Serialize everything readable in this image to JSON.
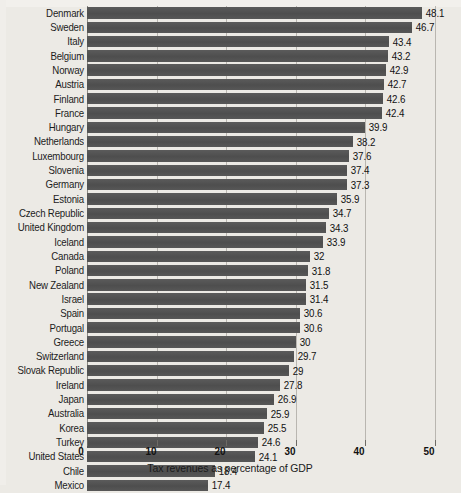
{
  "chart_data": {
    "type": "bar",
    "orientation": "horizontal",
    "title": "",
    "xlabel": "Tax revenues as percentage of GDP",
    "ylabel": "",
    "xlim": [
      0,
      50
    ],
    "xticks": [
      0,
      10,
      20,
      30,
      40,
      50
    ],
    "grid": true,
    "legend": false,
    "bar_color": "#545454",
    "background_color": "#eceae5",
    "categories": [
      "Denmark",
      "Sweden",
      "Italy",
      "Belgium",
      "Norway",
      "Austria",
      "Finland",
      "France",
      "Hungary",
      "Netherlands",
      "Luxembourg",
      "Slovenia",
      "Germany",
      "Estonia",
      "Czech Republic",
      "United Kingdom",
      "Iceland",
      "Canada",
      "Poland",
      "New Zealand",
      "Israel",
      "Spain",
      "Portugal",
      "Greece",
      "Switzerland",
      "Slovak Republic",
      "Ireland",
      "Japan",
      "Australia",
      "Korea",
      "Turkey",
      "United States",
      "Chile",
      "Mexico"
    ],
    "values": [
      48.1,
      46.7,
      43.4,
      43.2,
      42.9,
      42.7,
      42.6,
      42.4,
      39.9,
      38.2,
      37.6,
      37.4,
      37.3,
      35.9,
      34.7,
      34.3,
      33.9,
      32,
      31.8,
      31.5,
      31.4,
      30.6,
      30.6,
      30,
      29.7,
      29,
      27.8,
      26.9,
      25.9,
      25.5,
      24.6,
      24.1,
      18.4,
      17.4
    ],
    "value_labels": [
      "48.1",
      "46.7",
      "43.4",
      "43.2",
      "42.9",
      "42.7",
      "42.6",
      "42.4",
      "39.9",
      "38.2",
      "37.6",
      "37.4",
      "37.3",
      "35.9",
      "34.7",
      "34.3",
      "33.9",
      "32",
      "31.8",
      "31.5",
      "31.4",
      "30.6",
      "30.6",
      "30",
      "29.7",
      "29",
      "27.8",
      "26.9",
      "25.9",
      "25.5",
      "24.6",
      "24.1",
      "18.4",
      "17.4"
    ],
    "xtick_labels": [
      "0",
      "10",
      "20",
      "30",
      "40",
      "50"
    ]
  }
}
